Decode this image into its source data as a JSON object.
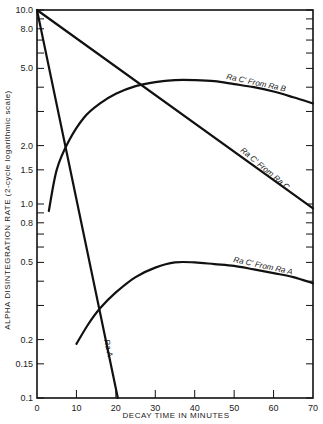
{
  "chart_data": {
    "type": "line",
    "title": "",
    "xlabel": "DECAY TIME IN MINUTES",
    "ylabel": "ALPHA DISINTEGRATION RATE   (2-cycle logarithmic scale)",
    "xlim": [
      0,
      70
    ],
    "ylim": [
      0.1,
      10.0
    ],
    "yscale": "log",
    "grid": false,
    "x_ticks": [
      0,
      10,
      20,
      30,
      40,
      50,
      60,
      70
    ],
    "x_tick_labels": [
      "0",
      "10",
      "20",
      "30",
      "40",
      "50",
      "60",
      "70"
    ],
    "y_ticks_labeled": [
      {
        "value": 10.0,
        "label": "10.0"
      },
      {
        "value": 8.0,
        "label": "8.0"
      },
      {
        "value": 5.0,
        "label": "5.0"
      },
      {
        "value": 2.0,
        "label": "2.0"
      },
      {
        "value": 1.5,
        "label": "1.5"
      },
      {
        "value": 1.0,
        "label": "1.0"
      },
      {
        "value": 0.8,
        "label": "0.8"
      },
      {
        "value": 0.5,
        "label": "0.5"
      },
      {
        "value": 0.2,
        "label": "0.2"
      },
      {
        "value": 0.15,
        "label": "0.15"
      },
      {
        "value": 0.1,
        "label": "0.1"
      }
    ],
    "y_minor_ticks": [
      9,
      7,
      6,
      4,
      3,
      0.9,
      0.7,
      0.6,
      0.4,
      0.3
    ],
    "series": [
      {
        "name": "Ra A",
        "label": "Ra A",
        "x": [
          0,
          20.5
        ],
        "y": [
          10.0,
          0.1
        ]
      },
      {
        "name": "Ra C' From Ra C",
        "label": "Ra C' From Ra C",
        "x": [
          0,
          70
        ],
        "y": [
          10.0,
          0.95
        ]
      },
      {
        "name": "Ra C' From Ra B",
        "label": "Ra C' From Ra B",
        "x": [
          3,
          5,
          8,
          12,
          16,
          20,
          25,
          30,
          35,
          40,
          45,
          50,
          55,
          60,
          65,
          70
        ],
        "y": [
          0.92,
          1.5,
          2.1,
          2.8,
          3.3,
          3.7,
          4.05,
          4.25,
          4.35,
          4.35,
          4.3,
          4.15,
          4.0,
          3.8,
          3.55,
          3.3
        ]
      },
      {
        "name": "Ra C' From Ra A",
        "label": "Ra C' From Ra A",
        "x": [
          10,
          13,
          16,
          20,
          25,
          30,
          35,
          40,
          45,
          50,
          55,
          60,
          65,
          70
        ],
        "y": [
          0.19,
          0.24,
          0.29,
          0.35,
          0.42,
          0.47,
          0.5,
          0.5,
          0.49,
          0.48,
          0.46,
          0.44,
          0.42,
          0.39
        ]
      }
    ]
  }
}
